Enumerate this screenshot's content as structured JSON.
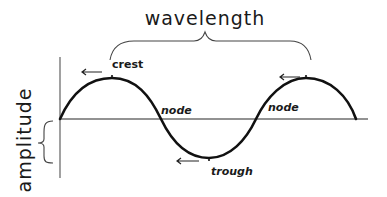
{
  "diagram": {
    "labels": {
      "wavelength": "wavelength",
      "amplitude": "amplitude",
      "crest": "crest",
      "trough": "trough",
      "node_1": "node",
      "node_2": "node"
    },
    "colors": {
      "wave": "#111111",
      "axis": "#6e6e6e",
      "brace": "#444444",
      "background": "#ffffff"
    },
    "features": [
      {
        "type": "crest",
        "label": "crest",
        "has_arrow": true
      },
      {
        "type": "node",
        "label": "node"
      },
      {
        "type": "trough",
        "label": "trough",
        "has_arrow": true
      },
      {
        "type": "node",
        "label": "node"
      },
      {
        "type": "crest",
        "label": "",
        "has_arrow": true
      }
    ]
  }
}
